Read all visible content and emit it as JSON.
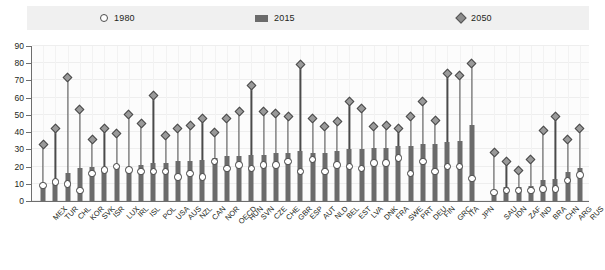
{
  "legend": {
    "items": [
      {
        "label": "1980",
        "marker": "circle-marker",
        "color": "#ffffff"
      },
      {
        "label": "2015",
        "marker": "square-marker",
        "color": "#6b6b6b"
      },
      {
        "label": "2050",
        "marker": "diamond-marker",
        "color": "#9a9a9a"
      }
    ]
  },
  "axis": {
    "y_ticks": [
      0,
      10,
      20,
      30,
      40,
      50,
      60,
      70,
      80,
      90
    ]
  },
  "chart_data": {
    "type": "bar",
    "title": "",
    "subtitle": "",
    "xlabel": "",
    "ylabel": "",
    "ylim": [
      0,
      90
    ],
    "ytick_step": 10,
    "grid": true,
    "legend_position": "top",
    "group_gap_after": "JPN",
    "categories": [
      "MEX",
      "TUR",
      "CHL",
      "KOR",
      "SVK",
      "ISR",
      "LUX",
      "IRL",
      "ISL",
      "POL",
      "USA",
      "AUS",
      "NZL",
      "CAN",
      "NOR",
      "OECD",
      "HUN",
      "SVN",
      "CZE",
      "CHE",
      "GBR",
      "ESP",
      "AUT",
      "NLD",
      "BEL",
      "EST",
      "LVA",
      "DNK",
      "FRA",
      "SWE",
      "PRT",
      "DEU",
      "FIN",
      "GRC",
      "ITA",
      "JPN",
      "SAU",
      "IDN",
      "ZAF",
      "IND",
      "BRA",
      "CHN",
      "ARG",
      "RUS"
    ],
    "series": [
      {
        "name": "1980",
        "marker": "circle",
        "values": [
          9,
          11,
          10,
          6,
          16,
          18,
          20,
          18,
          17,
          17,
          17,
          14,
          16,
          14,
          23,
          19,
          21,
          19,
          21,
          21,
          23,
          17,
          24,
          17,
          21,
          20,
          19,
          22,
          22,
          25,
          16,
          23,
          17,
          20,
          20,
          13,
          5,
          6,
          6,
          6,
          7,
          7,
          12,
          15
        ]
      },
      {
        "name": "2015",
        "marker": "square",
        "values": [
          10,
          12,
          16,
          19,
          20,
          19,
          21,
          20,
          21,
          22,
          22,
          23,
          23,
          24,
          25,
          26,
          26,
          27,
          27,
          28,
          28,
          29,
          28,
          28,
          29,
          30,
          30,
          31,
          31,
          32,
          32,
          33,
          33,
          34,
          35,
          44,
          4,
          8,
          8,
          9,
          12,
          13,
          17,
          19
        ]
      },
      {
        "name": "2050",
        "marker": "diamond",
        "values": [
          33,
          42,
          72,
          53,
          36,
          42,
          39,
          50,
          45,
          61,
          38,
          42,
          44,
          48,
          40,
          48,
          52,
          67,
          52,
          51,
          49,
          79,
          48,
          43,
          46,
          58,
          54,
          43,
          44,
          42,
          49,
          58,
          47,
          74,
          73,
          80,
          28,
          23,
          18,
          24,
          41,
          49,
          36,
          42
        ]
      }
    ]
  }
}
